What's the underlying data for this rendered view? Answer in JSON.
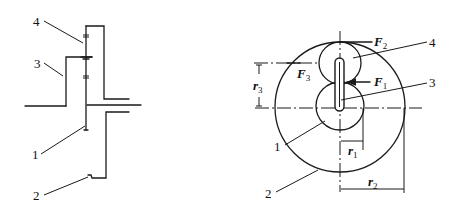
{
  "figure": {
    "left_view": {
      "callouts": [
        {
          "id": "1",
          "text": "1"
        },
        {
          "id": "2",
          "text": "2"
        },
        {
          "id": "3",
          "text": "3"
        },
        {
          "id": "4",
          "text": "4"
        }
      ]
    },
    "right_view": {
      "callouts": [
        {
          "id": "1",
          "text": "1"
        },
        {
          "id": "2",
          "text": "2"
        },
        {
          "id": "3",
          "text": "3"
        },
        {
          "id": "4",
          "text": "4"
        }
      ],
      "forces": [
        {
          "symbol": "F",
          "subscript": "1"
        },
        {
          "symbol": "F",
          "subscript": "2"
        },
        {
          "symbol": "F",
          "subscript": "3"
        }
      ],
      "dimensions": [
        {
          "symbol": "r",
          "subscript": "1"
        },
        {
          "symbol": "r",
          "subscript": "2"
        },
        {
          "symbol": "r",
          "subscript": "3"
        }
      ]
    }
  }
}
